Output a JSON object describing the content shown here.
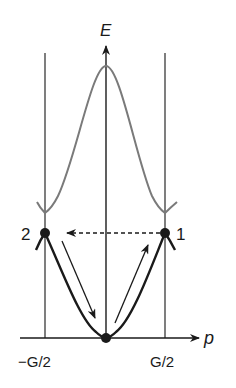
{
  "diagram": {
    "axes": {
      "vertical_label": "E",
      "horizontal_label": "p"
    },
    "tick_labels": {
      "left_boundary": "−G/2",
      "right_boundary": "G/2"
    },
    "points": [
      {
        "id": "point-1",
        "label": "1"
      },
      {
        "id": "point-2",
        "label": "2"
      }
    ],
    "bands": {
      "lower": "lower energy band (dark)",
      "upper": "upper energy band (gray)"
    },
    "transitions": {
      "umklapp": "dashed arrow from point 1 to point 2",
      "down_left": "arrow down along left branch",
      "up_right": "arrow up along right branch"
    },
    "colors": {
      "lower_band": "#1a1a1a",
      "upper_band": "#7a7a7a",
      "axes": "#1a1a1a",
      "boundaries": "#3a3a3a"
    }
  }
}
